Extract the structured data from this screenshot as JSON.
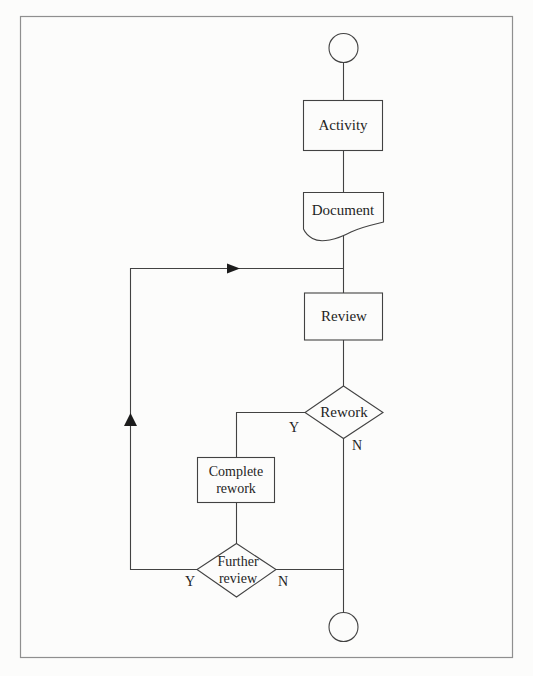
{
  "page": {
    "background_color": "#fcfcfb",
    "border_color": "#8f8f8f"
  },
  "flowchart": {
    "line_color": "#424242",
    "arrow_color": "#1c1c1c",
    "text_color": "#1f1f1f",
    "nodes": {
      "start": {
        "shape": "circle",
        "label": ""
      },
      "activity": {
        "shape": "rectangle",
        "label": "Activity"
      },
      "document": {
        "shape": "document",
        "label": "Document"
      },
      "review": {
        "shape": "rectangle",
        "label": "Review"
      },
      "rework": {
        "shape": "diamond",
        "label": "Rework"
      },
      "complete_rework": {
        "shape": "rectangle",
        "label": "Complete rework"
      },
      "further_review": {
        "shape": "diamond",
        "label": "Further review"
      },
      "end": {
        "shape": "circle",
        "label": ""
      }
    },
    "branches": {
      "rework_yes": "Y",
      "rework_no": "N",
      "further_review_yes": "Y",
      "further_review_no": "N"
    }
  }
}
